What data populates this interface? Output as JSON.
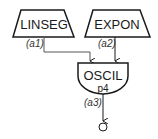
{
  "diagram": {
    "nodes": [
      {
        "id": "linseg",
        "label": "LINSEG",
        "shape": "trapezoid"
      },
      {
        "id": "expon",
        "label": "EXPON",
        "shape": "trapezoid"
      },
      {
        "id": "oscil",
        "label": "OSCIL",
        "sublabel": "p4",
        "shape": "half-rounded"
      },
      {
        "id": "out",
        "label": "",
        "shape": "circle"
      }
    ],
    "edges": [
      {
        "from": "linseg",
        "to": "oscil",
        "label": "(a1)"
      },
      {
        "from": "expon",
        "to": "oscil",
        "label": "(a2)"
      },
      {
        "from": "oscil",
        "to": "out",
        "label": "(a3)"
      }
    ],
    "colors": {
      "stroke": "#1a1a1a",
      "connector": "#555555",
      "background": "#ffffff"
    }
  }
}
